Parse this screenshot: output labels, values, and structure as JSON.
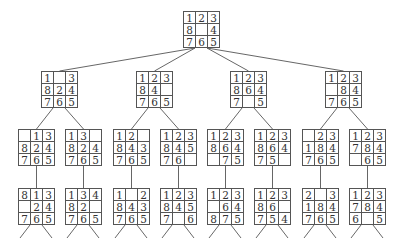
{
  "colors": {
    "line": "#555555",
    "text": "#333333",
    "background": "#ffffff"
  },
  "nodes": [
    {
      "id": "root",
      "level": 0,
      "x": 183,
      "y": 11,
      "cells": [
        "1",
        "2",
        "3",
        "8",
        "",
        "4",
        "7",
        "6",
        "5"
      ]
    },
    {
      "id": "l1a",
      "level": 1,
      "parent": "root",
      "x": 41,
      "y": 71,
      "cells": [
        "1",
        "",
        "3",
        "8",
        "2",
        "4",
        "7",
        "6",
        "5"
      ]
    },
    {
      "id": "l1b",
      "level": 1,
      "parent": "root",
      "x": 136,
      "y": 71,
      "cells": [
        "1",
        "2",
        "3",
        "8",
        "4",
        "",
        "7",
        "6",
        "5"
      ]
    },
    {
      "id": "l1c",
      "level": 1,
      "parent": "root",
      "x": 230,
      "y": 71,
      "cells": [
        "1",
        "2",
        "3",
        "8",
        "6",
        "4",
        "7",
        "",
        "5"
      ]
    },
    {
      "id": "l1d",
      "level": 1,
      "parent": "root",
      "x": 325,
      "y": 71,
      "cells": [
        "1",
        "2",
        "3",
        "",
        "8",
        "4",
        "7",
        "6",
        "5"
      ]
    },
    {
      "id": "l2a",
      "level": 2,
      "parent": "l1a",
      "x": 18,
      "y": 129,
      "cells": [
        "",
        "1",
        "3",
        "8",
        "2",
        "4",
        "7",
        "6",
        "5"
      ]
    },
    {
      "id": "l2b",
      "level": 2,
      "parent": "l1a",
      "x": 65,
      "y": 129,
      "cells": [
        "1",
        "3",
        "",
        "8",
        "2",
        "4",
        "7",
        "6",
        "5"
      ]
    },
    {
      "id": "l2c",
      "level": 2,
      "parent": "l1b",
      "x": 113,
      "y": 129,
      "cells": [
        "1",
        "2",
        "",
        "8",
        "4",
        "3",
        "7",
        "6",
        "5"
      ]
    },
    {
      "id": "l2d",
      "level": 2,
      "parent": "l1b",
      "x": 160,
      "y": 129,
      "cells": [
        "1",
        "2",
        "3",
        "8",
        "4",
        "5",
        "7",
        "6",
        ""
      ]
    },
    {
      "id": "l2e",
      "level": 2,
      "parent": "l1c",
      "x": 207,
      "y": 129,
      "cells": [
        "1",
        "2",
        "3",
        "8",
        "6",
        "4",
        "",
        "7",
        "5"
      ]
    },
    {
      "id": "l2f",
      "level": 2,
      "parent": "l1c",
      "x": 254,
      "y": 129,
      "cells": [
        "1",
        "2",
        "3",
        "8",
        "6",
        "4",
        "7",
        "5",
        ""
      ]
    },
    {
      "id": "l2g",
      "level": 2,
      "parent": "l1d",
      "x": 302,
      "y": 129,
      "cells": [
        "",
        "2",
        "3",
        "1",
        "8",
        "4",
        "7",
        "6",
        "5"
      ]
    },
    {
      "id": "l2h",
      "level": 2,
      "parent": "l1d",
      "x": 349,
      "y": 129,
      "cells": [
        "1",
        "2",
        "3",
        "7",
        "8",
        "4",
        "",
        "6",
        "5"
      ]
    },
    {
      "id": "l3a",
      "level": 3,
      "parent": "l2a",
      "x": 18,
      "y": 188,
      "cells": [
        "8",
        "1",
        "3",
        "",
        "2",
        "4",
        "7",
        "6",
        "5"
      ]
    },
    {
      "id": "l3b",
      "level": 3,
      "parent": "l2b",
      "x": 65,
      "y": 188,
      "cells": [
        "1",
        "3",
        "4",
        "8",
        "2",
        "",
        "7",
        "6",
        "5"
      ]
    },
    {
      "id": "l3c",
      "level": 3,
      "parent": "l2c",
      "x": 113,
      "y": 188,
      "cells": [
        "1",
        "",
        "2",
        "8",
        "4",
        "3",
        "7",
        "6",
        "5"
      ]
    },
    {
      "id": "l3d",
      "level": 3,
      "parent": "l2d",
      "x": 160,
      "y": 188,
      "cells": [
        "1",
        "2",
        "3",
        "8",
        "4",
        "5",
        "7",
        "",
        "6"
      ]
    },
    {
      "id": "l3e",
      "level": 3,
      "parent": "l2e",
      "x": 207,
      "y": 188,
      "cells": [
        "1",
        "2",
        "3",
        "",
        "6",
        "4",
        "8",
        "7",
        "5"
      ]
    },
    {
      "id": "l3f",
      "level": 3,
      "parent": "l2f",
      "x": 254,
      "y": 188,
      "cells": [
        "1",
        "2",
        "3",
        "8",
        "6",
        "",
        "7",
        "5",
        "4"
      ]
    },
    {
      "id": "l3g",
      "level": 3,
      "parent": "l2g",
      "x": 302,
      "y": 188,
      "cells": [
        "2",
        "",
        "3",
        "1",
        "8",
        "4",
        "7",
        "6",
        "5"
      ]
    },
    {
      "id": "l3h",
      "level": 3,
      "parent": "l2h",
      "x": 349,
      "y": 188,
      "cells": [
        "1",
        "2",
        "3",
        "7",
        "8",
        "4",
        "6",
        "",
        "5"
      ]
    }
  ],
  "trailing_edges": {
    "length_y": 13,
    "spread_x": 10
  }
}
